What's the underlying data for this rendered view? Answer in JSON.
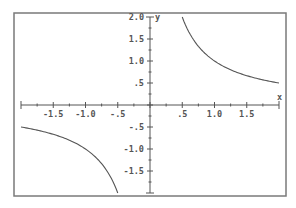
{
  "chart_data": {
    "type": "line",
    "title": "",
    "function": "y = 1/x",
    "xlabel": "x",
    "ylabel": "y",
    "xlim": [
      -2.0,
      2.0
    ],
    "ylim": [
      -2.0,
      2.0
    ],
    "grid": false,
    "x_major_ticks": [
      -1.5,
      -1.0,
      -0.5,
      0.5,
      1.0,
      1.5
    ],
    "x_tick_labels": [
      "-1.5",
      "-1.0",
      "-.5",
      ".5",
      "1.0",
      "1.5"
    ],
    "y_major_ticks": [
      2.0,
      1.5,
      1.0,
      0.5,
      -0.5,
      -1.0,
      -1.5
    ],
    "y_tick_labels": [
      "2.0",
      "1.5",
      "1.0",
      ".5",
      "-.5",
      "-1.0",
      "-1.5"
    ],
    "minor_tick_step": 0.25,
    "series": [
      {
        "name": "positive branch",
        "x": [
          0.5,
          0.6,
          0.7,
          0.8,
          0.9,
          1.0,
          1.2,
          1.4,
          1.6,
          1.8,
          2.0
        ],
        "y": [
          2.0,
          1.667,
          1.429,
          1.25,
          1.111,
          1.0,
          0.833,
          0.714,
          0.625,
          0.556,
          0.5
        ]
      },
      {
        "name": "negative branch",
        "x": [
          -2.0,
          -1.8,
          -1.6,
          -1.4,
          -1.2,
          -1.0,
          -0.9,
          -0.8,
          -0.7,
          -0.6,
          -0.5
        ],
        "y": [
          -0.5,
          -0.556,
          -0.625,
          -0.714,
          -0.833,
          -1.0,
          -1.111,
          -1.25,
          -1.429,
          -1.667,
          -2.0
        ]
      }
    ]
  }
}
